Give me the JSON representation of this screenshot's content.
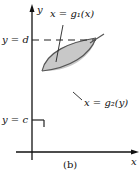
{
  "figure": {
    "caption": "(b)",
    "axes": {
      "x_label": "x",
      "y_label": "y"
    },
    "labels": {
      "y_d": "y = d",
      "y_c": "y = c",
      "curve1": "x = g₁(x)",
      "curve2": "x = g₂(y)"
    },
    "colors": {
      "region_fill": "#c8c8c8",
      "curve": "#555555",
      "axis": "#111111",
      "dash": "#222222"
    }
  }
}
